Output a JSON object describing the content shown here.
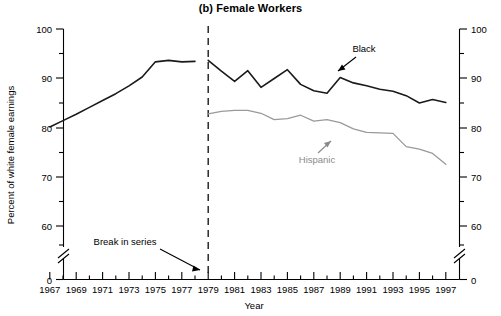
{
  "chart_data": {
    "type": "line",
    "title": "(b) Female Workers",
    "xlabel": "Year",
    "ylabel": "Percent of white female earnings",
    "xlim": [
      1967,
      1997
    ],
    "ylim": [
      55,
      100
    ],
    "y_axis_broken_at_zero": true,
    "grid": false,
    "legend": "annotated-inline",
    "y_ticks": [
      0,
      60,
      70,
      80,
      90,
      100
    ],
    "y_ticks_labeled": [
      "0",
      "60",
      "70",
      "80",
      "90",
      "100"
    ],
    "y_minor_ticks": [
      55,
      65,
      75,
      85,
      95
    ],
    "x_ticks": [
      1967,
      1968,
      1969,
      1970,
      1971,
      1972,
      1973,
      1974,
      1975,
      1976,
      1977,
      1978,
      1979,
      1980,
      1981,
      1982,
      1983,
      1984,
      1985,
      1986,
      1987,
      1988,
      1989,
      1990,
      1991,
      1992,
      1993,
      1994,
      1995,
      1996,
      1997
    ],
    "x_ticks_labeled": [
      "1967",
      "1969",
      "1971",
      "1973",
      "1975",
      "1977",
      "1979",
      "1981",
      "1983",
      "1985",
      "1987",
      "1989",
      "1991",
      "1993",
      "1995",
      "1997"
    ],
    "right_axis_mirrors_left": true,
    "break_year": 1979,
    "series": [
      {
        "name": "Black",
        "color": "#1a1a1a",
        "segment": "pre-break",
        "x": [
          1967,
          1968,
          1969,
          1970,
          1971,
          1972,
          1973,
          1974,
          1975,
          1976,
          1977,
          1978
        ],
        "values": [
          80.0,
          81.3,
          82.6,
          84.0,
          85.4,
          86.8,
          88.4,
          90.2,
          93.3,
          93.6,
          93.3,
          93.4
        ]
      },
      {
        "name": "Black",
        "color": "#1a1a1a",
        "segment": "post-break",
        "x": [
          1979,
          1980,
          1981,
          1982,
          1983,
          1984,
          1985,
          1986,
          1987,
          1988,
          1989,
          1990,
          1991,
          1992,
          1993,
          1994,
          1995,
          1996,
          1997
        ],
        "values": [
          93.6,
          91.4,
          89.3,
          91.5,
          88.1,
          89.9,
          91.7,
          88.7,
          87.4,
          86.9,
          90.1,
          89.0,
          88.4,
          87.7,
          87.3,
          86.4,
          84.9,
          85.6,
          85.0
        ]
      },
      {
        "name": "Hispanic",
        "color": "#9a9a9a",
        "segment": "post-break",
        "x": [
          1979,
          1980,
          1981,
          1982,
          1983,
          1984,
          1985,
          1986,
          1987,
          1988,
          1989,
          1990,
          1991,
          1992,
          1993,
          1994,
          1995,
          1996,
          1997
        ],
        "values": [
          82.7,
          83.2,
          83.4,
          83.4,
          82.8,
          81.5,
          81.7,
          82.4,
          81.2,
          81.5,
          80.9,
          79.6,
          78.9,
          78.8,
          78.7,
          76.0,
          75.5,
          74.6,
          72.4
        ]
      }
    ],
    "annotations": [
      {
        "name": "black-label",
        "text": "Black",
        "color": "#000000"
      },
      {
        "name": "hispanic-label",
        "text": "Hispanic",
        "color": "#8a8a8a"
      },
      {
        "name": "break-label",
        "text": "Break in series",
        "color": "#000000"
      }
    ]
  },
  "labels": {
    "title": "(b) Female Workers",
    "ylabel": "Percent of white female earnings",
    "xlabel": "Year",
    "black": "Black",
    "hispanic": "Hispanic",
    "break": "Break in series",
    "y0": "0",
    "y60": "60",
    "y70": "70",
    "y80": "80",
    "y90": "90",
    "y100": "100",
    "x1967": "1967",
    "x1969": "1969",
    "x1971": "1971",
    "x1973": "1973",
    "x1975": "1975",
    "x1977": "1977",
    "x1979": "1979",
    "x1981": "1981",
    "x1983": "1983",
    "x1985": "1985",
    "x1987": "1987",
    "x1989": "1989",
    "x1991": "1991",
    "x1993": "1993",
    "x1995": "1995",
    "x1997": "1997"
  }
}
